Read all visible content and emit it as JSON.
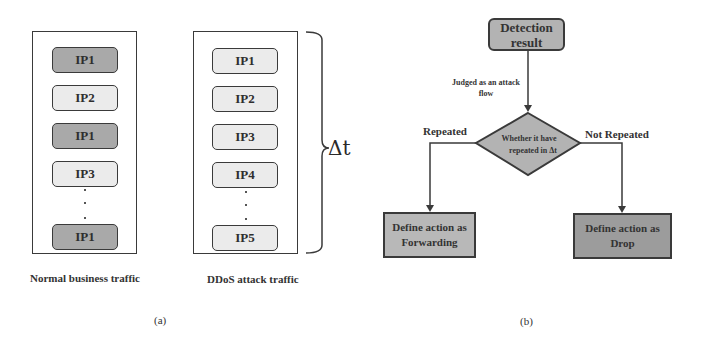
{
  "panel_a": {
    "normal": {
      "caption": "Normal business traffic",
      "items": [
        {
          "label": "IP1",
          "shade": "dark"
        },
        {
          "label": "IP2",
          "shade": "light"
        },
        {
          "label": "IP1",
          "shade": "dark"
        },
        {
          "label": "IP3",
          "shade": "light"
        },
        {
          "label": "IP1",
          "shade": "dark"
        }
      ]
    },
    "ddos": {
      "caption": "DDoS  attack traffic",
      "items": [
        {
          "label": "IP1",
          "shade": "light"
        },
        {
          "label": "IP2",
          "shade": "light"
        },
        {
          "label": "IP3",
          "shade": "light"
        },
        {
          "label": "IP4",
          "shade": "light"
        },
        {
          "label": "IP5",
          "shade": "light"
        }
      ]
    },
    "brace_label": "Δt",
    "sublabel": "(a)"
  },
  "panel_b": {
    "start_node": {
      "line1": "Detection",
      "line2": "result"
    },
    "edge_label": {
      "line1": "Judged as an attack",
      "line2": "flow"
    },
    "decision": {
      "line1": "Whether it have",
      "line2": "repeated in Δt"
    },
    "branch_left_label": "Repeated",
    "branch_right_label": "Not Repeated",
    "action_forward": {
      "line1": "Define action as",
      "line2": "Forwarding"
    },
    "action_drop": {
      "line1": "Define action as",
      "line2": "Drop"
    },
    "sublabel": "(b)"
  },
  "colors": {
    "dark_fill": "#a9a9a9",
    "light_fill": "#ebebeb",
    "node_fill": "#b3b3b3",
    "drop_fill": "#9c9c9c",
    "stroke": "#3a3a3a"
  }
}
